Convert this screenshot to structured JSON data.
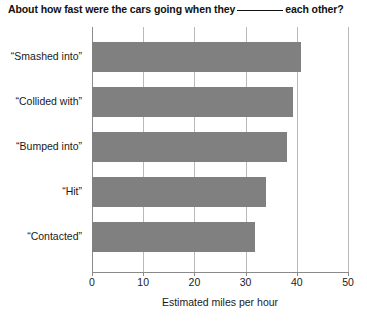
{
  "title": {
    "before_blank": "About how fast were the cars going when they",
    "after_blank": "each other?"
  },
  "chart_data": {
    "type": "bar",
    "orientation": "horizontal",
    "xlabel": "Estimated miles per hour",
    "ylabel": "",
    "categories": [
      "“Smashed into”",
      "“Collided with”",
      "“Bumped into”",
      "“Hit”",
      "“Contacted”"
    ],
    "values": [
      40.8,
      39.3,
      38.1,
      34.0,
      31.8
    ],
    "xlim": [
      0,
      50
    ],
    "xticks": [
      0,
      10,
      20,
      30,
      40,
      50
    ],
    "xtick_labels": [
      "0",
      "10",
      "20",
      "30",
      "40",
      "50"
    ],
    "grid": "vertical",
    "legend": "none",
    "bar_color": "#808080",
    "gridline_color": "#b9b9b9",
    "axis_color": "#8a8a8a",
    "background": "#ffffff"
  }
}
